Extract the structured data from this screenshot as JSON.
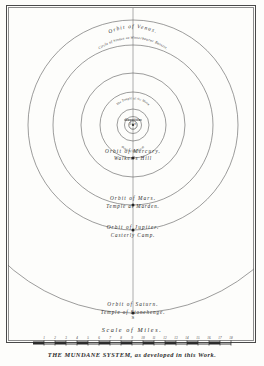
{
  "plate": {
    "caption": "THE MUNDANE SYSTEM, as developed in this Work.",
    "scale_title": "Scale of Miles.",
    "center_mark": "S",
    "ink_color": "#2c2c2c",
    "line_color": "#5b5b5b"
  },
  "center": {
    "temple_line_1": "The Temple of the Moon",
    "temple_line_2": "Caerlile",
    "temple_line_3": "and the Sun",
    "sun_label": "Sun",
    "orbit_moon": "Orbit of the Moon",
    "orbit_earth": "Orbit of the Earth"
  },
  "orbits": [
    {
      "id": "mercury",
      "orbit_label": "Orbit of Mercury.",
      "site_label": "Walker's Hill",
      "radius": 33,
      "label_y": 152
    },
    {
      "id": "venus",
      "orbit_label": "Orbit of Venus.",
      "site_label": "Circle of Stones at Winterbourne Bassett.",
      "radius": 52,
      "label_y": 72
    },
    {
      "id": "mars",
      "orbit_label": "Orbit of Mars.",
      "site_label": "Temple at Marden.",
      "radius": 80,
      "label_y": 198
    },
    {
      "id": "jupiter",
      "orbit_label": "Orbit of Jupiter.",
      "site_label": "Casterly Camp.",
      "radius": 105,
      "label_y": 227
    },
    {
      "id": "saturn",
      "orbit_label": "Orbit of Saturn.",
      "site_label": "Temple of Stonehenge.",
      "radius": 188,
      "label_y": 303
    }
  ],
  "scale": {
    "ticks": [
      "1",
      "2",
      "3",
      "4",
      "5",
      "6",
      "7",
      "8",
      "9",
      "10",
      "11",
      "12",
      "13",
      "14",
      "15",
      "16",
      "17",
      "18"
    ],
    "start_x": 33,
    "end_x": 231
  }
}
